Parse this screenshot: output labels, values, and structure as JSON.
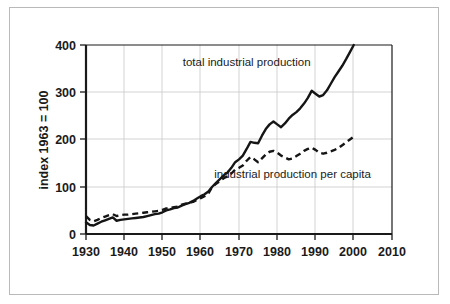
{
  "chart_data": {
    "type": "line",
    "title": "",
    "subtitle": "",
    "xlabel": "",
    "ylabel": "index 1963 = 100",
    "xlim": [
      1930,
      2010
    ],
    "ylim": [
      0,
      400
    ],
    "xticks": [
      1930,
      1940,
      1950,
      1960,
      1970,
      1980,
      1990,
      2000,
      2010
    ],
    "xtick_labels": [
      "1930",
      "1940",
      "1950",
      "1960",
      "1970",
      "1980",
      "1990",
      "2000",
      "2010"
    ],
    "yticks": [
      0,
      100,
      200,
      300,
      400
    ],
    "ytick_labels": [
      "0",
      "100",
      "200",
      "300",
      "400"
    ],
    "grid": "horizontal-and-vertical",
    "legend_position": "inline-annotations",
    "x": [
      1930,
      1931,
      1932,
      1933,
      1934,
      1935,
      1936,
      1937,
      1938,
      1939,
      1940,
      1941,
      1942,
      1943,
      1944,
      1945,
      1946,
      1947,
      1948,
      1949,
      1950,
      1951,
      1952,
      1953,
      1954,
      1955,
      1956,
      1957,
      1958,
      1959,
      1960,
      1961,
      1962,
      1963,
      1964,
      1965,
      1966,
      1967,
      1968,
      1969,
      1970,
      1971,
      1972,
      1973,
      1974,
      1975,
      1976,
      1977,
      1978,
      1979,
      1980,
      1981,
      1982,
      1983,
      1984,
      1985,
      1986,
      1987,
      1988,
      1989,
      1990,
      1991,
      1992,
      1993,
      1994,
      1995,
      1996,
      1997,
      1998,
      1999,
      2000
    ],
    "series": [
      {
        "name": "total industrial production",
        "style": "solid",
        "color": "#151515",
        "values": [
          25,
          19,
          18,
          22,
          26,
          29,
          32,
          35,
          28,
          30,
          31,
          32,
          33,
          34,
          35,
          36,
          38,
          40,
          42,
          43,
          46,
          50,
          52,
          55,
          56,
          60,
          63,
          66,
          70,
          75,
          80,
          84,
          90,
          100,
          108,
          116,
          124,
          130,
          140,
          152,
          158,
          166,
          180,
          195,
          193,
          192,
          208,
          222,
          232,
          238,
          232,
          226,
          234,
          244,
          252,
          258,
          266,
          276,
          288,
          303,
          297,
          291,
          294,
          304,
          318,
          332,
          344,
          356,
          370,
          385,
          400
        ]
      },
      {
        "name": "industrial production per capita",
        "style": "dashed",
        "color": "#151515",
        "values": [
          38,
          30,
          27,
          30,
          34,
          37,
          40,
          42,
          38,
          40,
          41,
          41,
          42,
          43,
          44,
          45,
          46,
          47,
          48,
          49,
          51,
          54,
          55,
          57,
          58,
          62,
          64,
          66,
          68,
          72,
          76,
          80,
          86,
          100,
          106,
          112,
          118,
          122,
          128,
          136,
          140,
          145,
          155,
          163,
          158,
          152,
          160,
          168,
          174,
          176,
          172,
          166,
          162,
          158,
          160,
          165,
          170,
          176,
          180,
          183,
          178,
          172,
          170,
          172,
          175,
          178,
          182,
          188,
          194,
          200,
          206
        ]
      }
    ],
    "annotations": [
      {
        "text": "total industrial production",
        "x": 1972,
        "y": 356,
        "anchor": "middle",
        "name": "annotation-total-industrial-production"
      },
      {
        "text": "industrial production per capita",
        "x": 1984,
        "y": 118,
        "anchor": "middle",
        "name": "annotation-industrial-production-per-capita"
      }
    ]
  },
  "colors": {
    "axis": "#1a1a1a",
    "grid": "#c8c8c8",
    "series": "#151515",
    "background": "#ffffff",
    "outer_border": "#b9b9b9"
  }
}
